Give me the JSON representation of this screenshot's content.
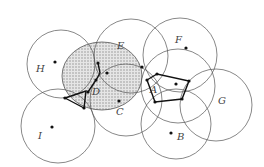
{
  "diagram": {
    "width": 264,
    "height": 167,
    "circles": [
      {
        "id": "H",
        "cx": 61,
        "cy": 64,
        "r": 34
      },
      {
        "id": "E-big",
        "cx": 131,
        "cy": 56,
        "r": 37
      },
      {
        "id": "F",
        "cx": 180,
        "cy": 55,
        "r": 37
      },
      {
        "id": "A",
        "cx": 178,
        "cy": 86,
        "r": 37
      },
      {
        "id": "G",
        "cx": 216,
        "cy": 105,
        "r": 36
      },
      {
        "id": "B",
        "cx": 176,
        "cy": 124,
        "r": 35
      },
      {
        "id": "C",
        "cx": 126,
        "cy": 100,
        "r": 36
      },
      {
        "id": "I",
        "cx": 58,
        "cy": 126,
        "r": 37
      }
    ],
    "shaded": {
      "id": "D-region",
      "cx": 102,
      "cy": 76,
      "rx": 40,
      "ry": 34
    },
    "points": [
      {
        "id": "H",
        "x": 55,
        "y": 62
      },
      {
        "id": "F",
        "x": 186,
        "y": 48
      },
      {
        "id": "C",
        "x": 119,
        "y": 101
      },
      {
        "id": "I",
        "x": 52,
        "y": 127
      },
      {
        "id": "B",
        "x": 171,
        "y": 133
      },
      {
        "id": "A-center",
        "x": 176,
        "y": 84
      },
      {
        "id": "E-dot",
        "x": 142,
        "y": 67
      }
    ],
    "polygons": [
      {
        "id": "A-pentagon",
        "points": "147,80 157,74 189,81 182,99 155,102"
      },
      {
        "id": "D-triangle",
        "points": "65,98 86,91 84,108"
      },
      {
        "id": "center-path",
        "points": "98,63 100,73 96,80 88,92"
      }
    ],
    "vertices": [
      {
        "x": 98,
        "y": 63
      },
      {
        "x": 107,
        "y": 73
      },
      {
        "x": 96,
        "y": 80
      },
      {
        "x": 88,
        "y": 92
      },
      {
        "x": 65,
        "y": 98
      },
      {
        "x": 84,
        "y": 108
      },
      {
        "x": 147,
        "y": 80
      },
      {
        "x": 157,
        "y": 74
      },
      {
        "x": 189,
        "y": 81
      },
      {
        "x": 182,
        "y": 99
      },
      {
        "x": 155,
        "y": 102
      }
    ],
    "labels": [
      {
        "text": "H",
        "x": 36,
        "y": 72
      },
      {
        "text": "E",
        "x": 117,
        "y": 49
      },
      {
        "text": "F",
        "x": 175,
        "y": 43
      },
      {
        "text": "D",
        "x": 92,
        "y": 95
      },
      {
        "text": "A",
        "x": 150,
        "y": 93
      },
      {
        "text": "C",
        "x": 116,
        "y": 115
      },
      {
        "text": "G",
        "x": 218,
        "y": 104
      },
      {
        "text": "I",
        "x": 38,
        "y": 139
      },
      {
        "text": "B",
        "x": 177,
        "y": 140
      }
    ],
    "colors": {
      "stroke": "#555555",
      "bold": "#111111",
      "fill": "#cfcfcf"
    }
  }
}
